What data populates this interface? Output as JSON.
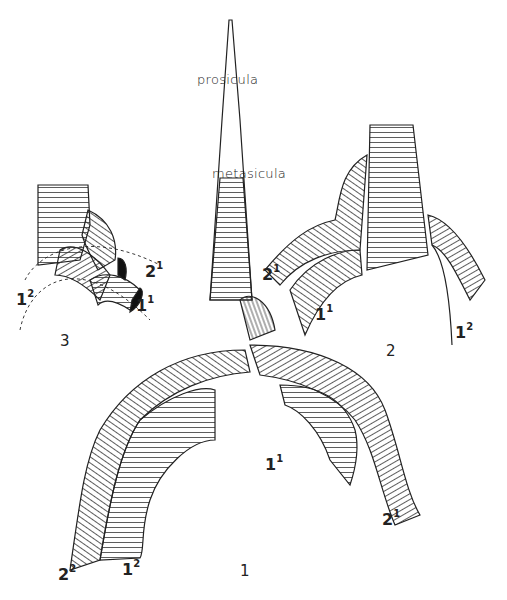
{
  "figure": {
    "annotations": {
      "prosicula": "prosicula",
      "metasicula": "metasicula"
    },
    "figure_numbers": {
      "fig1": "1",
      "fig2": "2",
      "fig3": "3"
    },
    "fig1_labels": [
      {
        "base": "1",
        "sup": "1"
      },
      {
        "base": "2",
        "sup": "1"
      },
      {
        "base": "2",
        "sup": "2"
      },
      {
        "base": "1",
        "sup": "2"
      }
    ],
    "fig2_labels": [
      {
        "base": "2",
        "sup": "1"
      },
      {
        "base": "1",
        "sup": "1"
      },
      {
        "base": "1",
        "sup": "2"
      }
    ],
    "fig3_labels": [
      {
        "base": "1",
        "sup": "2"
      },
      {
        "base": "2",
        "sup": "1"
      },
      {
        "base": "1",
        "sup": "1"
      }
    ]
  }
}
